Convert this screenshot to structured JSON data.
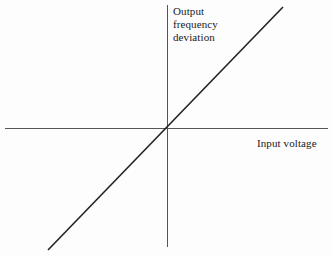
{
  "figure": {
    "width": 332,
    "height": 257,
    "background_color": "#fdfdfd"
  },
  "axes": {
    "x_axis": {
      "name": "horizontal-axis",
      "y": 128,
      "x_start": 5,
      "x_end": 328,
      "color": "#555555",
      "stroke_width": 1
    },
    "y_axis": {
      "name": "vertical-axis",
      "x": 167,
      "y_start": 5,
      "y_end": 247,
      "color": "#555555",
      "stroke_width": 1
    },
    "origin": {
      "x": 167,
      "y": 128
    }
  },
  "labels": {
    "y_axis_label_lines": [
      "Output",
      "frequency",
      "deviation"
    ],
    "y_axis_label_text": "Output frequency deviation",
    "x_axis_label": "Input voltage"
  },
  "chart_data": {
    "type": "line",
    "title": "",
    "subtitle": "",
    "xlabel": "Input voltage",
    "ylabel": "Output frequency deviation",
    "grid": false,
    "legend": false,
    "legend_position": "none",
    "axis_style": "centered-cross-through-origin",
    "xlim": [
      -1,
      1
    ],
    "ylim": [
      -1,
      1
    ],
    "xticks": [],
    "yticks": [],
    "xticklabels": [],
    "yticklabels": [],
    "annotations": [],
    "series": [
      {
        "name": "transfer characteristic",
        "description": "straight line of positive constant slope passing through the origin",
        "color": "#222222",
        "stroke_width": 1.6,
        "linestyle": "solid",
        "slope": 1.034,
        "intercept": 0,
        "x": [
          -1,
          0,
          1
        ],
        "y": [
          -1,
          0,
          1
        ],
        "pixel_endpoints": {
          "x1": 48,
          "y1": 250,
          "x2": 283,
          "y2": 7
        }
      }
    ]
  }
}
